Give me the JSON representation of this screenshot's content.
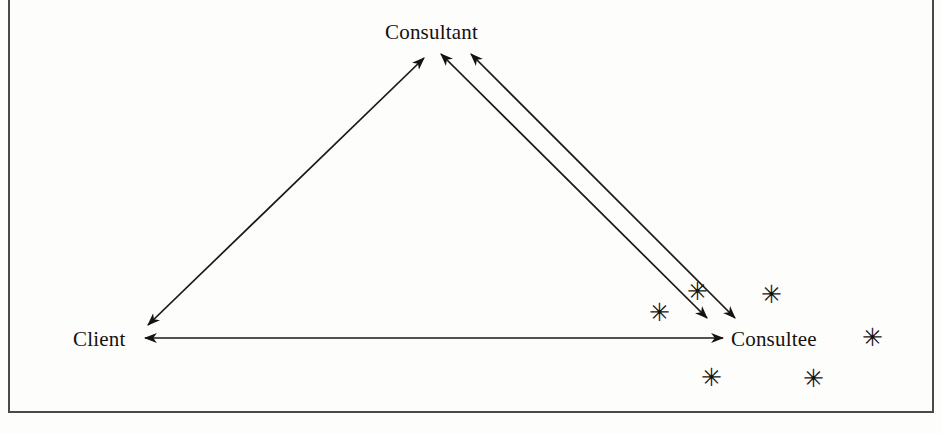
{
  "figure": {
    "type": "relationship-triangle-diagram",
    "background_color": "#fdfdfc",
    "ink_color": "#15120f",
    "frame_color": "#4a4a4a",
    "nodes": [
      {
        "id": "consultant",
        "label": "Consultant",
        "x": 437,
        "y": 34
      },
      {
        "id": "client",
        "label": "Client",
        "x": 103,
        "y": 340
      },
      {
        "id": "consultee",
        "label": "Consultee",
        "x": 780,
        "y": 340
      }
    ],
    "connections": [
      {
        "id": "client-consultant",
        "from": "client",
        "to": "consultant",
        "arrowheads": "both",
        "style": "single-line"
      },
      {
        "id": "consultee-consultant-outer",
        "from": "consultee",
        "to": "consultant",
        "arrowheads": "both",
        "style": "single-line"
      },
      {
        "id": "consultee-consultant-inner",
        "from": "consultee",
        "to": "consultant",
        "arrowheads": "both",
        "style": "single-line"
      },
      {
        "id": "client-consultee",
        "from": "client",
        "to": "consultee",
        "arrowheads": "both",
        "style": "single-line"
      }
    ],
    "asterisks": [
      {
        "id": "asterisk-1",
        "glyph": "✳",
        "x": 658,
        "y": 311
      },
      {
        "id": "asterisk-2",
        "glyph": "✳",
        "x": 696,
        "y": 290
      },
      {
        "id": "asterisk-3",
        "glyph": "✳",
        "x": 770,
        "y": 293
      },
      {
        "id": "asterisk-4",
        "glyph": "✳",
        "x": 871,
        "y": 336
      },
      {
        "id": "asterisk-5",
        "glyph": "✳",
        "x": 710,
        "y": 376
      },
      {
        "id": "asterisk-6",
        "glyph": "✳",
        "x": 812,
        "y": 377
      }
    ]
  }
}
